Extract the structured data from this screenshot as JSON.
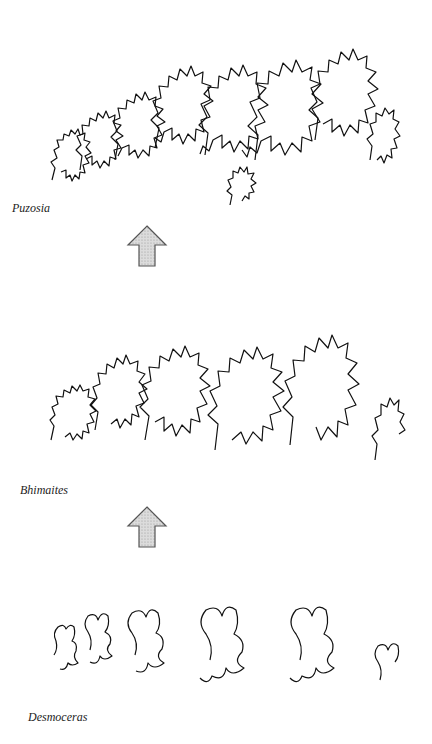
{
  "figure": {
    "panels": [
      {
        "id": "top",
        "label": "Puzosia",
        "complexity": "high"
      },
      {
        "id": "middle",
        "label": "Bhimaites",
        "complexity": "medium"
      },
      {
        "id": "bottom",
        "label": "Desmoceras",
        "complexity": "low"
      }
    ],
    "arrows": [
      {
        "from": "Desmoceras",
        "to": "Bhimaites",
        "direction": "up"
      },
      {
        "from": "Bhimaites",
        "to": "Puzosia",
        "direction": "up"
      }
    ],
    "colors": {
      "line": "#111111",
      "arrow_fill": "#d4d4d4",
      "arrow_stroke": "#555555",
      "background": "#ffffff"
    }
  }
}
